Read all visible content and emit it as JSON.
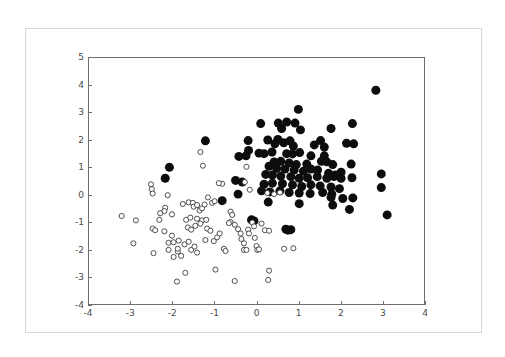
{
  "figure": {
    "title": "",
    "background_color": "#ffffff",
    "frame_color": "#d8d8d8",
    "axis_color": "#6f6f6f"
  },
  "chart_data": {
    "type": "scatter",
    "title": "",
    "xlabel": "",
    "ylabel": "",
    "xlim": [
      -4,
      4
    ],
    "ylim": [
      -4,
      5
    ],
    "grid": false,
    "legend": null,
    "xticks": [
      -4,
      -3,
      -2,
      -1,
      0,
      1,
      2,
      3,
      4
    ],
    "xticklabels": [
      "-4",
      "-3",
      "-2",
      "-1",
      "0",
      "1",
      "2",
      "3",
      "4"
    ],
    "yticks": [
      -4,
      -3,
      -2,
      -1,
      0,
      1,
      2,
      3,
      4,
      5
    ],
    "yticklabels": [
      "-4",
      "-3",
      "-2",
      "-1",
      "0",
      "1",
      "2",
      "3",
      "4",
      "5"
    ],
    "series": [
      {
        "name": "class-1-filled",
        "marker": "filled-circle",
        "color": "#0d0d0d",
        "marker_size": 7.0,
        "points": [
          [
            2.85,
            3.82
          ],
          [
            1.0,
            3.12
          ],
          [
            0.72,
            2.66
          ],
          [
            0.52,
            2.62
          ],
          [
            0.92,
            2.62
          ],
          [
            0.1,
            2.6
          ],
          [
            2.29,
            2.6
          ],
          [
            1.78,
            2.42
          ],
          [
            0.6,
            2.42
          ],
          [
            1.05,
            2.37
          ],
          [
            -1.22,
            1.97
          ],
          [
            0.27,
            2.0
          ],
          [
            0.51,
            2.02
          ],
          [
            0.8,
            1.97
          ],
          [
            -0.2,
            1.98
          ],
          [
            0.65,
            1.9
          ],
          [
            0.44,
            1.86
          ],
          [
            1.53,
            1.98
          ],
          [
            1.38,
            1.82
          ],
          [
            2.15,
            1.88
          ],
          [
            2.32,
            1.86
          ],
          [
            1.62,
            1.74
          ],
          [
            0.88,
            1.78
          ],
          [
            -0.19,
            1.62
          ],
          [
            -0.25,
            1.42
          ],
          [
            0.06,
            1.52
          ],
          [
            0.18,
            1.5
          ],
          [
            0.37,
            1.56
          ],
          [
            0.72,
            1.5
          ],
          [
            0.86,
            1.49
          ],
          [
            1.03,
            1.54
          ],
          [
            1.3,
            1.42
          ],
          [
            1.62,
            1.42
          ],
          [
            -0.42,
            1.4
          ],
          [
            -2.08,
            1.0
          ],
          [
            -2.18,
            0.6
          ],
          [
            0.42,
            1.2
          ],
          [
            0.58,
            1.22
          ],
          [
            0.78,
            1.16
          ],
          [
            0.95,
            1.1
          ],
          [
            1.2,
            1.12
          ],
          [
            1.55,
            1.22
          ],
          [
            1.68,
            1.2
          ],
          [
            1.82,
            1.1
          ],
          [
            2.26,
            1.12
          ],
          [
            0.3,
            1.04
          ],
          [
            0.48,
            0.96
          ],
          [
            0.68,
            0.94
          ],
          [
            0.9,
            0.9
          ],
          [
            1.12,
            0.86
          ],
          [
            1.3,
            0.94
          ],
          [
            1.46,
            0.9
          ],
          [
            1.72,
            0.78
          ],
          [
            1.88,
            0.72
          ],
          [
            2.02,
            0.82
          ],
          [
            2.28,
            0.62
          ],
          [
            2.98,
            0.76
          ],
          [
            0.22,
            0.74
          ],
          [
            0.38,
            0.72
          ],
          [
            0.58,
            0.68
          ],
          [
            0.82,
            0.66
          ],
          [
            1.02,
            0.6
          ],
          [
            1.22,
            0.62
          ],
          [
            1.45,
            0.66
          ],
          [
            1.68,
            0.6
          ],
          [
            1.85,
            0.66
          ],
          [
            2.02,
            0.6
          ],
          [
            2.98,
            0.26
          ],
          [
            -0.5,
            0.52
          ],
          [
            -0.34,
            0.46
          ],
          [
            0.18,
            0.38
          ],
          [
            0.38,
            0.42
          ],
          [
            0.62,
            0.4
          ],
          [
            0.86,
            0.36
          ],
          [
            1.08,
            0.3
          ],
          [
            1.3,
            0.36
          ],
          [
            1.52,
            0.32
          ],
          [
            1.78,
            0.28
          ],
          [
            1.98,
            0.22
          ],
          [
            0.12,
            0.14
          ],
          [
            0.32,
            0.1
          ],
          [
            0.56,
            0.14
          ],
          [
            0.78,
            0.08
          ],
          [
            1.02,
            0.06
          ],
          [
            1.28,
            0.04
          ],
          [
            1.58,
            0.08
          ],
          [
            1.8,
            0.02
          ],
          [
            -0.44,
            0.02
          ],
          [
            -0.82,
            -0.22
          ],
          [
            0.28,
            -0.27
          ],
          [
            1.02,
            -0.33
          ],
          [
            1.78,
            -0.1
          ],
          [
            2.06,
            -0.14
          ],
          [
            2.3,
            -0.12
          ],
          [
            1.82,
            -0.38
          ],
          [
            2.22,
            -0.54
          ],
          [
            3.12,
            -0.74
          ],
          [
            0.75,
            -1.3
          ],
          [
            0.82,
            -1.28
          ],
          [
            0.7,
            -1.26
          ],
          [
            -0.12,
            -0.92
          ],
          [
            -0.06,
            -0.96
          ]
        ]
      },
      {
        "name": "class-2-open",
        "marker": "open-circle",
        "color": "#ffffff",
        "edge_color": "#3c3c3c",
        "marker_size": 4.0,
        "points": [
          [
            -3.22,
            -0.78
          ],
          [
            -2.88,
            -0.94
          ],
          [
            -2.52,
            0.38
          ],
          [
            -2.5,
            0.2
          ],
          [
            -2.48,
            0.04
          ],
          [
            -2.32,
            -0.92
          ],
          [
            -2.48,
            -1.24
          ],
          [
            -2.42,
            -1.3
          ],
          [
            -2.2,
            -1.34
          ],
          [
            -2.1,
            -1.76
          ],
          [
            -2.12,
            -0.02
          ],
          [
            -2.18,
            -0.48
          ],
          [
            -2.2,
            -0.6
          ],
          [
            -2.3,
            -0.68
          ],
          [
            -2.02,
            -0.72
          ],
          [
            -2.94,
            -1.78
          ],
          [
            -2.46,
            -2.14
          ],
          [
            -2.1,
            -2.02
          ],
          [
            -1.98,
            -1.74
          ],
          [
            -1.86,
            -1.68
          ],
          [
            -1.88,
            -2.08
          ],
          [
            -1.8,
            -2.24
          ],
          [
            -1.72,
            -1.82
          ],
          [
            -1.62,
            -1.72
          ],
          [
            -1.56,
            -2.02
          ],
          [
            -1.48,
            -1.9
          ],
          [
            -1.42,
            -2.12
          ],
          [
            -1.9,
            -3.18
          ],
          [
            -1.7,
            -2.86
          ],
          [
            -1.76,
            -0.34
          ],
          [
            -1.62,
            -0.28
          ],
          [
            -1.52,
            -0.3
          ],
          [
            -1.5,
            -0.44
          ],
          [
            -1.42,
            -0.38
          ],
          [
            -1.36,
            -0.58
          ],
          [
            -1.3,
            -0.5
          ],
          [
            -1.24,
            -0.36
          ],
          [
            -1.34,
            1.56
          ],
          [
            -1.28,
            1.06
          ],
          [
            -1.42,
            -0.88
          ],
          [
            -1.3,
            -0.94
          ],
          [
            -1.2,
            -0.92
          ],
          [
            -1.18,
            -1.24
          ],
          [
            -1.1,
            -1.32
          ],
          [
            -1.22,
            -1.66
          ],
          [
            -1.02,
            -1.7
          ],
          [
            -0.94,
            -1.56
          ],
          [
            -0.88,
            -1.42
          ],
          [
            -0.98,
            -2.74
          ],
          [
            -0.78,
            -1.98
          ],
          [
            -0.74,
            -2.06
          ],
          [
            -0.82,
            0.4
          ],
          [
            -0.9,
            0.42
          ],
          [
            -0.62,
            -0.62
          ],
          [
            -0.58,
            -0.74
          ],
          [
            -0.52,
            -1.1
          ],
          [
            -0.44,
            -1.26
          ],
          [
            -0.38,
            -1.42
          ],
          [
            -0.36,
            -1.62
          ],
          [
            -0.3,
            -1.78
          ],
          [
            -0.3,
            -2.02
          ],
          [
            -0.24,
            -2.02
          ],
          [
            -0.2,
            -1.28
          ],
          [
            -0.18,
            -1.42
          ],
          [
            -0.16,
            0.18
          ],
          [
            -0.28,
            0.46
          ],
          [
            -0.24,
            1.02
          ],
          [
            -0.1,
            -1.02
          ],
          [
            -0.06,
            -1.16
          ],
          [
            -0.04,
            -1.58
          ],
          [
            0.0,
            -1.88
          ],
          [
            0.02,
            -2.02
          ],
          [
            0.06,
            -2.0
          ],
          [
            0.12,
            -1.06
          ],
          [
            0.2,
            -1.3
          ],
          [
            0.3,
            -1.32
          ],
          [
            0.3,
            -2.78
          ],
          [
            0.28,
            -3.12
          ],
          [
            -0.52,
            -3.16
          ],
          [
            0.66,
            -1.98
          ],
          [
            0.88,
            -1.96
          ],
          [
            0.26,
            0.06
          ],
          [
            0.42,
            0.02
          ],
          [
            0.56,
            0.08
          ],
          [
            -0.62,
            -1.0
          ],
          [
            -0.66,
            -1.04
          ],
          [
            -1.06,
            -0.3
          ],
          [
            -1.0,
            -0.24
          ],
          [
            -1.16,
            -0.1
          ],
          [
            -1.88,
            -1.98
          ],
          [
            -1.98,
            -2.28
          ],
          [
            -2.02,
            -1.5
          ],
          [
            -1.64,
            -1.2
          ],
          [
            -1.56,
            -1.28
          ],
          [
            -1.46,
            -1.14
          ],
          [
            -1.34,
            -1.06
          ],
          [
            -1.68,
            -0.92
          ],
          [
            -1.58,
            -0.84
          ]
        ]
      }
    ]
  }
}
